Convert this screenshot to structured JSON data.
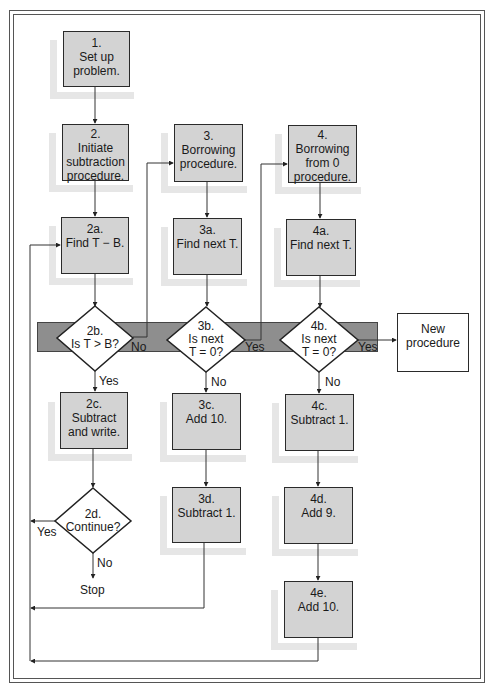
{
  "diagram": {
    "type": "flowchart",
    "title": "",
    "boxes": {
      "b1": {
        "num": "1.",
        "text": [
          "Set up",
          "problem."
        ]
      },
      "b2": {
        "num": "2.",
        "text": [
          "Initiate",
          "subtraction",
          "procedure."
        ]
      },
      "b2a": {
        "num": "2a.",
        "text": [
          "Find T − B."
        ]
      },
      "b2c": {
        "num": "2c.",
        "text": [
          "Subtract",
          "and write."
        ]
      },
      "b3": {
        "num": "3.",
        "text": [
          "Borrowing",
          "procedure."
        ]
      },
      "b3a": {
        "num": "3a.",
        "text": [
          "Find next T."
        ]
      },
      "b3c": {
        "num": "3c.",
        "text": [
          "Add 10."
        ]
      },
      "b3d": {
        "num": "3d.",
        "text": [
          "Subtract 1."
        ]
      },
      "b4": {
        "num": "4.",
        "text": [
          "Borrowing",
          "from 0",
          "procedure."
        ]
      },
      "b4a": {
        "num": "4a.",
        "text": [
          "Find next T."
        ]
      },
      "b4c": {
        "num": "4c.",
        "text": [
          "Subtract 1."
        ]
      },
      "b4d": {
        "num": "4d.",
        "text": [
          "Add 9."
        ]
      },
      "b4e": {
        "num": "4e.",
        "text": [
          "Add 10."
        ]
      },
      "new": {
        "text": [
          "New",
          "procedure"
        ]
      }
    },
    "decisions": {
      "d2b": {
        "num": "2b.",
        "text": [
          "Is T > B?"
        ]
      },
      "d3b": {
        "num": "3b.",
        "text": [
          "Is next",
          "T = 0?"
        ]
      },
      "d4b": {
        "num": "4b.",
        "text": [
          "Is next",
          "T = 0?"
        ]
      },
      "d2d": {
        "num": "2d.",
        "text": [
          "Continue?"
        ]
      }
    },
    "edge_labels": {
      "d2b_no": "No",
      "d2b_yes": "Yes",
      "d3b_yes": "Yes",
      "d3b_no": "No",
      "d4b_yes": "Yes",
      "d4b_no": "No",
      "d2d_yes": "Yes",
      "d2d_no": "No",
      "stop": "Stop"
    },
    "colors": {
      "box_fill": "#d3d3d3",
      "shadow": "#e6e6e6",
      "band": "#8e8e8e",
      "line": "#333333"
    }
  }
}
